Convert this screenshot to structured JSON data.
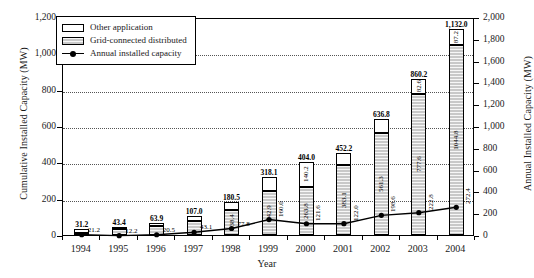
{
  "chart_data": {
    "type": "bar",
    "title": "",
    "xlabel": "Year",
    "ylabel": "Cumulative Installed Capacity (MW)",
    "ylabel_right": "Annual Installed Capacity (MW)",
    "ylim": [
      0,
      1200
    ],
    "ylim_right": [
      0,
      2000
    ],
    "grid": true,
    "legend_position": "upper-left-inside",
    "categories": [
      "1994",
      "1995",
      "1996",
      "1997",
      "1998",
      "1999",
      "2000",
      "2001",
      "2002",
      "2003",
      "2004"
    ],
    "series": [
      {
        "name": "Grid-connected distributed",
        "axis": "left",
        "values": [
          12.0,
          33.3,
          47.0,
          75.3,
          138.4,
          242.9,
          263.8,
          383.1,
          561.3,
          777.6,
          1044.8
        ]
      },
      {
        "name": "Other application",
        "axis": "left",
        "values": [
          19.2,
          10.1,
          16.9,
          31.7,
          42.1,
          75.2,
          140.2,
          69.1,
          75.5,
          82.6,
          87.2
        ]
      },
      {
        "name": "Annual installed capacity",
        "axis": "right",
        "values": [
          21.2,
          12.2,
          20.5,
          43.1,
          77.8,
          160.0,
          121.6,
          122.0,
          198.6,
          222.8,
          272.4
        ]
      }
    ],
    "bar_totals": [
      "31.2",
      "43.4",
      "63.9",
      "107.0",
      "180.5",
      "318.1",
      "404.0",
      "452.2",
      "636.8",
      "860.2",
      "1,132.0"
    ],
    "bar_total_values": [
      31.2,
      43.4,
      63.9,
      107.0,
      180.5,
      318.1,
      404.0,
      452.2,
      636.8,
      860.2,
      1132.0
    ],
    "segment_labels_other": [
      "",
      "",
      "",
      "",
      "",
      "75.2",
      "140.2",
      "69.1",
      "75.5",
      "82.6",
      "87.2"
    ],
    "segment_labels_grid": [
      "",
      "33.3",
      "47.0",
      "",
      "138.4",
      "242.9",
      "263.8",
      "383.1",
      "561.3",
      "777.6",
      "1044.8"
    ],
    "annual_labels": [
      "21.2",
      "12.2",
      "20.5",
      "43.1",
      "77.8",
      "160.0",
      "121.6",
      "122.0",
      "198.6",
      "222.8",
      "272.4"
    ],
    "yticks_left": [
      "0",
      "200",
      "400",
      "600",
      "800",
      "1,000",
      "1,200"
    ],
    "ytick_left_values": [
      0,
      200,
      400,
      600,
      800,
      1000,
      1200
    ],
    "yticks_right": [
      "0",
      "200",
      "400",
      "600",
      "800",
      "1,000",
      "1,200",
      "1,400",
      "1,600",
      "1,800",
      "2,000"
    ],
    "ytick_right_values": [
      0,
      200,
      400,
      600,
      800,
      1000,
      1200,
      1400,
      1600,
      1800,
      2000
    ]
  },
  "legend": {
    "items": [
      {
        "label": "Other application",
        "key": "other"
      },
      {
        "label": "Grid-connected distributed",
        "key": "grid"
      },
      {
        "label": "Annual installed capacity",
        "key": "line"
      }
    ]
  },
  "colors": {
    "other_fill": "#ffffff",
    "grid_fill": "#c9c9c9",
    "line": "#000000",
    "axis": "#000000",
    "gridline": "#555555"
  }
}
